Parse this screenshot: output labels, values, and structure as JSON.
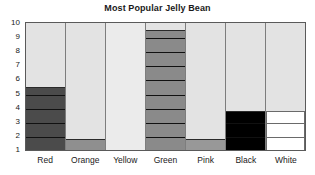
{
  "chart_data": {
    "type": "bar",
    "title": "Most Popular Jelly Bean",
    "xlabel": "",
    "ylabel": "",
    "categories": [
      "Red",
      "Orange",
      "Yellow",
      "Green",
      "Pink",
      "Black",
      "White"
    ],
    "values": [
      5.5,
      1.8,
      0,
      9.5,
      1.8,
      3.8,
      3.8
    ],
    "ylim": [
      1,
      10
    ],
    "yticks": [
      10,
      9,
      8,
      7,
      6,
      5,
      4,
      3,
      2,
      1
    ],
    "grid": false,
    "legend": "none",
    "bar_colors": [
      "#4b4b4b",
      "#8f8f8f",
      "#ebebeb",
      "#8a8a8a",
      "#989898",
      "#000000",
      "#ffffff"
    ],
    "plot_background": "#e3e3e3",
    "frame_color": "#5a5a5a",
    "divider_color": "#111111",
    "segment_unit": 1
  },
  "chart": {
    "title": "Most Popular Jelly Bean"
  }
}
